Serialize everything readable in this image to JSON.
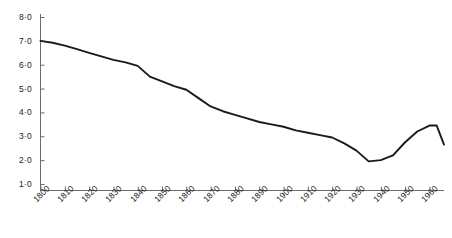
{
  "chart_data": {
    "type": "line",
    "title": "",
    "subtitle": "",
    "xlabel": "",
    "ylabel": "",
    "xlim": [
      1800,
      1966
    ],
    "ylim": [
      0,
      8
    ],
    "grid": false,
    "legend": null,
    "decimal_separator": "·",
    "line_color": "#1a1a1a",
    "axis_color": "#6b6b6b",
    "x_tick_labels": [
      "1800",
      "1810",
      "1820",
      "1830",
      "1840",
      "1850",
      "1860",
      "1870",
      "1880",
      "1890",
      "1900",
      "1910",
      "1920",
      "1930",
      "1940",
      "1950",
      "1960"
    ],
    "x_tick_values": [
      1800,
      1810,
      1820,
      1830,
      1840,
      1850,
      1860,
      1870,
      1880,
      1890,
      1900,
      1910,
      1920,
      1930,
      1940,
      1950,
      1960
    ],
    "y_tick_labels": [
      "8·0",
      "7·0",
      "6·0",
      "5·0",
      "4·0",
      "3·0",
      "2·0",
      "1·0"
    ],
    "y_tick_values": [
      8.0,
      7.0,
      6.0,
      5.0,
      4.0,
      3.0,
      2.0,
      1.0
    ],
    "series": [
      {
        "name": "series-1",
        "x": [
          1800,
          1805,
          1810,
          1815,
          1820,
          1825,
          1830,
          1835,
          1840,
          1845,
          1850,
          1855,
          1860,
          1865,
          1870,
          1875,
          1880,
          1885,
          1890,
          1895,
          1900,
          1905,
          1910,
          1915,
          1920,
          1925,
          1930,
          1935,
          1940,
          1945,
          1950,
          1955,
          1960,
          1963,
          1966
        ],
        "values": [
          7.0,
          6.92,
          6.8,
          6.65,
          6.5,
          6.35,
          6.2,
          6.1,
          5.95,
          5.5,
          5.3,
          5.1,
          4.95,
          4.6,
          4.25,
          4.05,
          3.9,
          3.75,
          3.6,
          3.5,
          3.4,
          3.25,
          3.15,
          3.05,
          2.95,
          2.7,
          2.4,
          1.95,
          2.0,
          2.2,
          2.75,
          3.2,
          3.45,
          3.45,
          2.65
        ]
      }
    ]
  },
  "axes": {
    "y_axis_name": "vertical-axis",
    "x_axis_name": "horizontal-axis"
  }
}
